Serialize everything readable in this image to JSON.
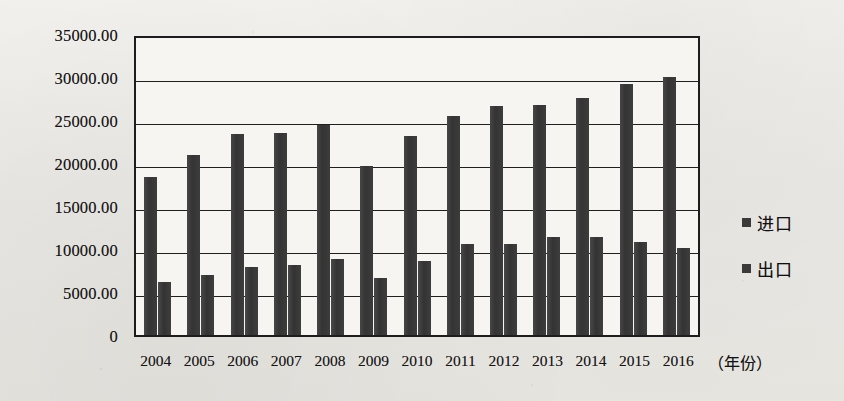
{
  "chart_data": {
    "type": "bar",
    "title": "",
    "xlabel": "（年份）",
    "ylabel": "",
    "categories": [
      "2004",
      "2005",
      "2006",
      "2007",
      "2008",
      "2009",
      "2010",
      "2011",
      "2012",
      "2013",
      "2014",
      "2015",
      "2016"
    ],
    "series": [
      {
        "name": "进口",
        "values": [
          18400,
          20900,
          23400,
          23500,
          24400,
          19700,
          23200,
          25500,
          26600,
          26700,
          27600,
          29200,
          30000
        ]
      },
      {
        "name": "出口",
        "values": [
          6200,
          7000,
          7900,
          8100,
          8800,
          6600,
          8600,
          10600,
          10600,
          11400,
          11400,
          10800,
          10100
        ]
      }
    ],
    "ylim": [
      0,
      35000
    ],
    "ytick_labels": [
      "35000.00",
      "30000.00",
      "25000.00",
      "20000.00",
      "15000.00",
      "10000.00",
      "5000.00",
      "0"
    ],
    "ytick_values": [
      35000,
      30000,
      25000,
      20000,
      15000,
      10000,
      5000,
      0
    ],
    "grid": true,
    "legend_position": "right",
    "bar_color": "#3a3a3a",
    "axis_color": "#1d1d1d",
    "plot_background": "#f6f5f2"
  }
}
